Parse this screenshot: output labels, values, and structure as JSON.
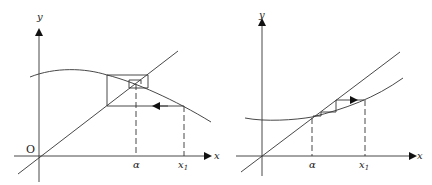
{
  "figure": {
    "left_panel": {
      "y_axis_label": "y",
      "x_axis_label": "x",
      "origin_label": "O",
      "tick_labels": [
        "α",
        "x"
      ],
      "x1_subscript": "1",
      "curve": "decreasing concave curve (oscillating convergence)",
      "line": "y = x"
    },
    "right_panel": {
      "y_axis_label": "y",
      "x_axis_label": "x",
      "tick_labels": [
        "α",
        "x"
      ],
      "x1_subscript": "1",
      "curve": "increasing convex curve (staircase convergence)",
      "line": "y = x"
    }
  }
}
